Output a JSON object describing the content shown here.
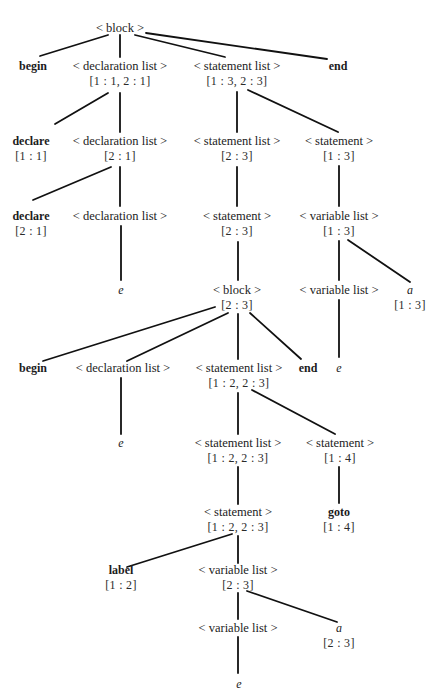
{
  "diagram": {
    "type": "parse-tree",
    "nodes": [
      {
        "id": "n0",
        "label": "< block >",
        "attr": "",
        "kind": "nt",
        "x": 120,
        "y": 21
      },
      {
        "id": "n1",
        "label": "begin",
        "attr": "",
        "kind": "kw",
        "x": 33,
        "y": 59
      },
      {
        "id": "n2",
        "label": "< declaration list >",
        "attr": "[1 : 1, 2 : 1]",
        "kind": "nt",
        "x": 120,
        "y": 59
      },
      {
        "id": "n3",
        "label": "< statement list >",
        "attr": "[1 : 3, 2 : 3]",
        "kind": "nt",
        "x": 237,
        "y": 59
      },
      {
        "id": "n4",
        "label": "end",
        "attr": "",
        "kind": "kw",
        "x": 338,
        "y": 59
      },
      {
        "id": "n5",
        "label": "declare",
        "attr": "[1 : 1]",
        "kind": "kw",
        "x": 31,
        "y": 134
      },
      {
        "id": "n6",
        "label": "< declaration list >",
        "attr": "[2 : 1]",
        "kind": "nt",
        "x": 120,
        "y": 134
      },
      {
        "id": "n7",
        "label": "< statement list >",
        "attr": "[2 : 3]",
        "kind": "nt",
        "x": 237,
        "y": 134
      },
      {
        "id": "n8",
        "label": "< statement >",
        "attr": "[1 : 3]",
        "kind": "nt",
        "x": 339,
        "y": 134
      },
      {
        "id": "n9",
        "label": "declare",
        "attr": "[2 : 1]",
        "kind": "kw",
        "x": 31,
        "y": 209
      },
      {
        "id": "n10",
        "label": "< declaration list >",
        "attr": "",
        "kind": "nt",
        "x": 120,
        "y": 209
      },
      {
        "id": "n11",
        "label": "< statement >",
        "attr": "[2 : 3]",
        "kind": "nt",
        "x": 237,
        "y": 209
      },
      {
        "id": "n12",
        "label": "< variable list >",
        "attr": "[1 : 3]",
        "kind": "nt",
        "x": 339,
        "y": 209
      },
      {
        "id": "n13",
        "label": "e",
        "attr": "",
        "kind": "var",
        "x": 121,
        "y": 283
      },
      {
        "id": "n14",
        "label": "< block >",
        "attr": "[2 : 3]",
        "kind": "nt",
        "x": 237,
        "y": 283
      },
      {
        "id": "n15",
        "label": "< variable list >",
        "attr": "",
        "kind": "nt",
        "x": 339,
        "y": 283
      },
      {
        "id": "n16",
        "label": "a",
        "attr": "[1 : 3]",
        "kind": "var",
        "x": 410,
        "y": 283
      },
      {
        "id": "n17",
        "label": "begin",
        "attr": "",
        "kind": "kw",
        "x": 33,
        "y": 361
      },
      {
        "id": "n18",
        "label": "< declaration list >",
        "attr": "",
        "kind": "nt",
        "x": 123,
        "y": 361
      },
      {
        "id": "n19",
        "label": "< statement list >",
        "attr": "[1 : 2, 2 : 3]",
        "kind": "nt",
        "x": 239,
        "y": 361
      },
      {
        "id": "n20",
        "label": "end",
        "attr": "",
        "kind": "kw",
        "x": 308,
        "y": 361
      },
      {
        "id": "n21",
        "label": "e",
        "attr": "",
        "kind": "var",
        "x": 339,
        "y": 361
      },
      {
        "id": "n22",
        "label": "e",
        "attr": "",
        "kind": "var",
        "x": 121,
        "y": 436
      },
      {
        "id": "n23",
        "label": "< statement list >",
        "attr": "[1 : 2, 2 : 3]",
        "kind": "nt",
        "x": 238,
        "y": 436
      },
      {
        "id": "n24",
        "label": "< statement >",
        "attr": "[1 : 4]",
        "kind": "nt",
        "x": 340,
        "y": 436
      },
      {
        "id": "n25",
        "label": "< statement >",
        "attr": "[1 : 2, 2 : 3]",
        "kind": "nt",
        "x": 238,
        "y": 505
      },
      {
        "id": "n26",
        "label": "goto",
        "attr": "[1 : 4]",
        "kind": "kw",
        "x": 339,
        "y": 505
      },
      {
        "id": "n27",
        "label": "label",
        "attr": "[1 : 2]",
        "kind": "kw",
        "x": 121,
        "y": 563
      },
      {
        "id": "n28",
        "label": "< variable list >",
        "attr": "[2 : 3]",
        "kind": "nt",
        "x": 238,
        "y": 563
      },
      {
        "id": "n29",
        "label": "< variable list >",
        "attr": "",
        "kind": "nt",
        "x": 238,
        "y": 621
      },
      {
        "id": "n30",
        "label": "a",
        "attr": "[2 : 3]",
        "kind": "var",
        "x": 339,
        "y": 621
      },
      {
        "id": "n31",
        "label": "e",
        "attr": "",
        "kind": "var",
        "x": 239,
        "y": 677
      }
    ],
    "edges": [
      {
        "from": "n0",
        "to": "n1",
        "x1": 108,
        "y1": 35,
        "x2": 40,
        "y2": 56
      },
      {
        "from": "n0",
        "to": "n2",
        "x1": 120,
        "y1": 35,
        "x2": 120,
        "y2": 57
      },
      {
        "from": "n0",
        "to": "n3",
        "x1": 135,
        "y1": 35,
        "x2": 225,
        "y2": 57
      },
      {
        "from": "n0",
        "to": "n4",
        "x1": 146,
        "y1": 33,
        "x2": 327,
        "y2": 59
      },
      {
        "from": "n2",
        "to": "n5",
        "x1": 108,
        "y1": 93,
        "x2": 55,
        "y2": 124
      },
      {
        "from": "n2",
        "to": "n6",
        "x1": 120,
        "y1": 93,
        "x2": 120,
        "y2": 132
      },
      {
        "from": "n3",
        "to": "n7",
        "x1": 237,
        "y1": 92,
        "x2": 237,
        "y2": 132
      },
      {
        "from": "n3",
        "to": "n8",
        "x1": 248,
        "y1": 90,
        "x2": 338,
        "y2": 132
      },
      {
        "from": "n6",
        "to": "n9",
        "x1": 111,
        "y1": 167,
        "x2": 33,
        "y2": 200
      },
      {
        "from": "n6",
        "to": "n10",
        "x1": 120,
        "y1": 167,
        "x2": 120,
        "y2": 206
      },
      {
        "from": "n7",
        "to": "n11",
        "x1": 237,
        "y1": 167,
        "x2": 237,
        "y2": 206
      },
      {
        "from": "n8",
        "to": "n12",
        "x1": 339,
        "y1": 166,
        "x2": 339,
        "y2": 206
      },
      {
        "from": "n10",
        "to": "n13",
        "x1": 121,
        "y1": 226,
        "x2": 121,
        "y2": 280
      },
      {
        "from": "n11",
        "to": "n14",
        "x1": 238,
        "y1": 242,
        "x2": 238,
        "y2": 280
      },
      {
        "from": "n12",
        "to": "n15",
        "x1": 339,
        "y1": 241,
        "x2": 339,
        "y2": 280
      },
      {
        "from": "n12",
        "to": "n16",
        "x1": 348,
        "y1": 240,
        "x2": 410,
        "y2": 282
      },
      {
        "from": "n14",
        "to": "n17",
        "x1": 215,
        "y1": 307,
        "x2": 43,
        "y2": 361
      },
      {
        "from": "n14",
        "to": "n18",
        "x1": 228,
        "y1": 313,
        "x2": 127,
        "y2": 361
      },
      {
        "from": "n14",
        "to": "n19",
        "x1": 238,
        "y1": 314,
        "x2": 238,
        "y2": 359
      },
      {
        "from": "n14",
        "to": "n20",
        "x1": 250,
        "y1": 313,
        "x2": 301,
        "y2": 359
      },
      {
        "from": "n15",
        "to": "n21",
        "x1": 339,
        "y1": 300,
        "x2": 339,
        "y2": 357
      },
      {
        "from": "n18",
        "to": "n22",
        "x1": 121,
        "y1": 378,
        "x2": 121,
        "y2": 434
      },
      {
        "from": "n19",
        "to": "n23",
        "x1": 238,
        "y1": 393,
        "x2": 238,
        "y2": 434
      },
      {
        "from": "n19",
        "to": "n24",
        "x1": 252,
        "y1": 390,
        "x2": 335,
        "y2": 434
      },
      {
        "from": "n23",
        "to": "n25",
        "x1": 238,
        "y1": 467,
        "x2": 238,
        "y2": 504
      },
      {
        "from": "n24",
        "to": "n26",
        "x1": 339,
        "y1": 467,
        "x2": 339,
        "y2": 503
      },
      {
        "from": "n25",
        "to": "n27",
        "x1": 232,
        "y1": 534,
        "x2": 127,
        "y2": 567
      },
      {
        "from": "n25",
        "to": "n28",
        "x1": 238,
        "y1": 536,
        "x2": 238,
        "y2": 563
      },
      {
        "from": "n28",
        "to": "n29",
        "x1": 238,
        "y1": 593,
        "x2": 238,
        "y2": 619
      },
      {
        "from": "n28",
        "to": "n30",
        "x1": 247,
        "y1": 591,
        "x2": 337,
        "y2": 622
      },
      {
        "from": "n29",
        "to": "n31",
        "x1": 238,
        "y1": 637,
        "x2": 238,
        "y2": 673
      }
    ]
  }
}
